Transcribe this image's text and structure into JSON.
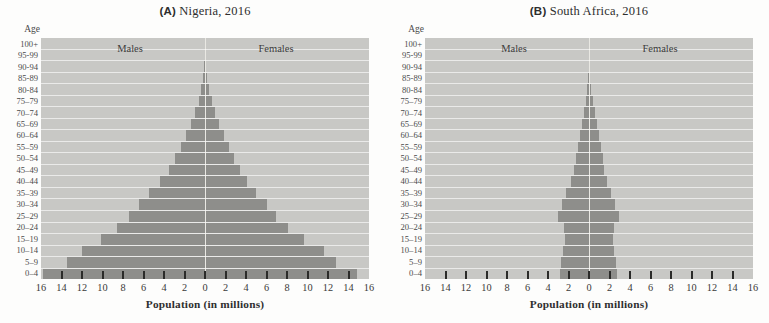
{
  "colors": {
    "bar": "#8e8e8b",
    "band": "#c8c8c5",
    "separator": "#f1f0ec",
    "tick": "#2b2b29",
    "text": "#3b3b3b",
    "page_background": "#fdfdfc"
  },
  "chart_data": [
    {
      "type": "bar",
      "subtype": "population-pyramid",
      "panel_label": "(A)",
      "title": "Nigeria, 2016",
      "age_axis_label": "Age",
      "xlabel": "Population (in millions)",
      "side_labels": {
        "left": "Males",
        "right": "Females"
      },
      "x_max": 16,
      "x_tick_step": 2,
      "x_tick_labels": [
        "16",
        "14",
        "12",
        "10",
        "8",
        "6",
        "4",
        "2",
        "0",
        "2",
        "4",
        "6",
        "8",
        "10",
        "12",
        "14",
        "16"
      ],
      "age_groups": [
        "100+",
        "95-99",
        "90-94",
        "85-89",
        "80-84",
        "75–79",
        "70–74",
        "65–69",
        "60–64",
        "55–59",
        "50–54",
        "45–49",
        "40–44",
        "35–39",
        "30–34",
        "25–29",
        "20–24",
        "15–19",
        "10–14",
        "5–9",
        "0–4"
      ],
      "series": [
        {
          "name": "Males",
          "values": [
            0.02,
            0.03,
            0.06,
            0.15,
            0.35,
            0.6,
            1.0,
            1.4,
            1.9,
            2.35,
            2.9,
            3.5,
            4.4,
            5.5,
            6.4,
            7.4,
            8.6,
            10.1,
            12.0,
            13.5,
            15.8
          ]
        },
        {
          "name": "Females",
          "values": [
            0.02,
            0.04,
            0.07,
            0.18,
            0.4,
            0.65,
            1.0,
            1.4,
            1.85,
            2.3,
            2.85,
            3.4,
            4.1,
            5.0,
            6.0,
            6.9,
            8.1,
            9.7,
            11.6,
            12.8,
            14.8
          ]
        }
      ]
    },
    {
      "type": "bar",
      "subtype": "population-pyramid",
      "panel_label": "(B)",
      "title": "South Africa, 2016",
      "age_axis_label": "Age",
      "xlabel": "Population (in millions)",
      "side_labels": {
        "left": "Males",
        "right": "Females"
      },
      "x_max": 16,
      "x_tick_step": 2,
      "x_tick_labels": [
        "16",
        "14",
        "12",
        "10",
        "8",
        "6",
        "4",
        "2",
        "0",
        "2",
        "4",
        "6",
        "8",
        "10",
        "12",
        "14",
        "16"
      ],
      "age_groups": [
        "100+",
        "95-99",
        "90-94",
        "85-89",
        "80-84",
        "75–79",
        "70–74",
        "65–69",
        "60–64",
        "55–59",
        "50–54",
        "45–49",
        "40–44",
        "35–39",
        "30–34",
        "25–29",
        "20–24",
        "15–19",
        "10–14",
        "5–9",
        "0–4"
      ],
      "series": [
        {
          "name": "Males",
          "values": [
            0.01,
            0.02,
            0.04,
            0.08,
            0.18,
            0.3,
            0.5,
            0.7,
            0.9,
            1.1,
            1.3,
            1.5,
            1.8,
            2.2,
            2.6,
            3.0,
            2.4,
            2.35,
            2.5,
            2.7,
            2.8
          ]
        },
        {
          "name": "Females",
          "values": [
            0.01,
            0.03,
            0.06,
            0.12,
            0.22,
            0.38,
            0.55,
            0.75,
            1.0,
            1.2,
            1.4,
            1.5,
            1.8,
            2.1,
            2.5,
            2.9,
            2.4,
            2.3,
            2.45,
            2.65,
            2.7
          ]
        }
      ]
    }
  ]
}
